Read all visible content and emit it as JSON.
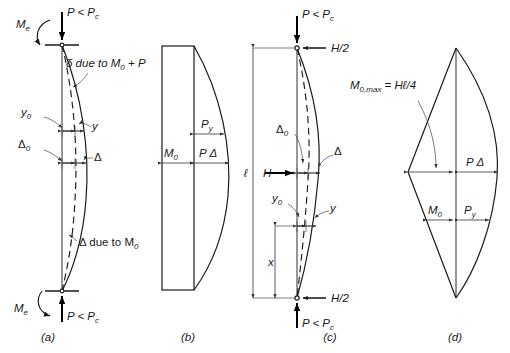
{
  "figure": {
    "panels": [
      {
        "id": "a",
        "caption": "(a)",
        "kind": "deflected-shape",
        "description": "Fixed-end column with end moments Me and axial load P, deflected by M0 and P",
        "labels": {
          "top_load": "P < P",
          "top_load_sub": "c",
          "bottom_load": "P < P",
          "bottom_load_sub": "c",
          "end_moment_top": "M",
          "end_moment_top_sub": "e",
          "end_moment_bottom": "M",
          "end_moment_bottom_sub": "e",
          "delta_due": "δ due to M",
          "delta_due_sub": "0",
          "delta_due_tail": " + P",
          "y0": "y",
          "y0_sub": "0",
          "y": "y",
          "Delta0": "Δ",
          "Delta0_sub": "0",
          "Delta": "Δ",
          "delta_due_to_M0": "Δ due to M",
          "delta_due_to_M0_sub": "0"
        }
      },
      {
        "id": "b",
        "caption": "(b)",
        "kind": "moment-diagram",
        "description": "Moment diagram: constant M0 rectangle plus PΔ bulge",
        "labels": {
          "M0": "M",
          "M0_sub": "0",
          "PDelta": "P Δ",
          "Py": "P",
          "Py_sub": "y"
        }
      },
      {
        "id": "c",
        "caption": "(c)",
        "kind": "deflected-shape",
        "description": "Pin-ended column with transverse load H at midheight and axial load P",
        "labels": {
          "top_load": "P < P",
          "top_load_sub": "c",
          "bottom_load": "P < P",
          "bottom_load_sub": "c",
          "reaction_top": "H/2",
          "reaction_bottom": "H/2",
          "span": "ℓ",
          "transverse_load": "H",
          "moment_max": "M",
          "moment_max_sub": "0,max",
          "moment_max_tail": " = Hℓ/4",
          "Delta0": "Δ",
          "Delta0_sub": "0",
          "Delta": "Δ",
          "y0": "y",
          "y0_sub": "0",
          "y": "y",
          "x": "x"
        }
      },
      {
        "id": "d",
        "caption": "(d)",
        "kind": "moment-diagram",
        "description": "Moment diagram: triangular M0 plus PΔ bulge",
        "labels": {
          "M0": "M",
          "M0_sub": "0",
          "PDelta": "P Δ",
          "Py": "P",
          "Py_sub": "y"
        }
      }
    ],
    "colors": {
      "ink": "#1a1a1a",
      "thin": "#555555",
      "background": "#ffffff"
    }
  }
}
